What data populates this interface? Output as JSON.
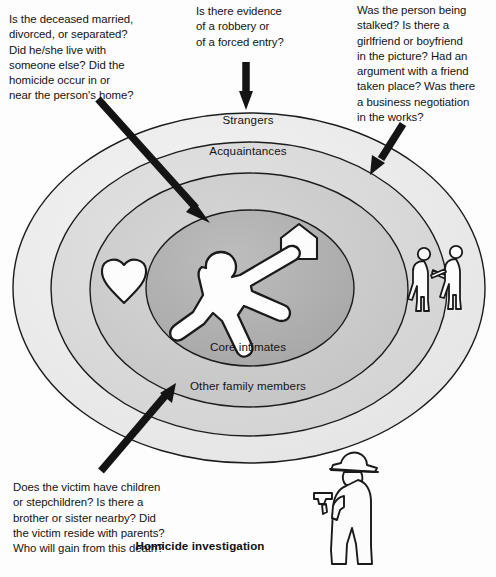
{
  "diagram": {
    "caption": "Homicide investigation",
    "rings": [
      {
        "id": "strangers",
        "label": "Strangers",
        "fill": "#ededed"
      },
      {
        "id": "acquaintances",
        "label": "Acquaintances",
        "fill": "#dcdcdc"
      },
      {
        "id": "other_family",
        "label": "Other family members",
        "fill": "#cfcfcf"
      },
      {
        "id": "core_intimates",
        "label": "Core intimates",
        "fill": "#b3b3b3"
      }
    ],
    "annotations": [
      {
        "id": "married",
        "target": "core_intimates",
        "text": "Is the deceased married,\ndivorced, or separated?\nDid he/she live with\nsomeone else? Did the\nhomicide occur in or\nnear the person's home?"
      },
      {
        "id": "robbery",
        "target": "strangers",
        "text": "Is there evidence\nof a robbery or\nof a forced entry?"
      },
      {
        "id": "stalked",
        "target": "acquaintances",
        "text": "Was the person being\nstalked? Is there a\ngirlfriend or boyfriend\nin the picture? Had an\nargument with a friend\ntaken place? Was there\na business negotiation\nin the works?"
      },
      {
        "id": "children",
        "target": "other_family",
        "text": "Does the victim have children\nor stepchildren? Is there a\nbrother or sister nearby? Did\nthe victim reside with parents?\nWho will gain from this death?"
      }
    ],
    "icons": [
      {
        "id": "victim-body",
        "name": "victim-body-outline-icon",
        "ring": "core_intimates"
      },
      {
        "id": "house",
        "name": "house-icon",
        "ring": "core_intimates"
      },
      {
        "id": "heart",
        "name": "heart-icon",
        "ring": "other_family"
      },
      {
        "id": "couple",
        "name": "couple-holding-hands-icon",
        "ring": "strangers"
      },
      {
        "id": "detective",
        "name": "detective-with-gun-icon",
        "ring": "outside"
      }
    ],
    "colors": {
      "outline": "#1a1a1a",
      "arrow": "#141414",
      "text": "#131313",
      "ring_outer": "#ededed",
      "ring_second": "#dcdcdc",
      "ring_third": "#cfcfcf",
      "ring_core": "#b3b3b3",
      "icon_fill": "#fdfdfd"
    }
  }
}
